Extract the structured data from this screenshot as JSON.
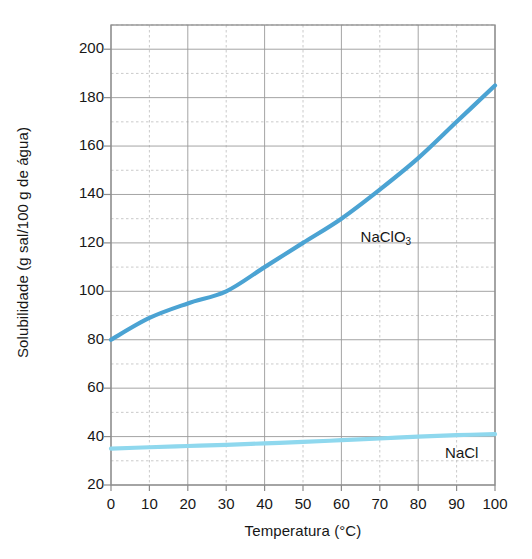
{
  "chart_data": {
    "type": "line",
    "title": "",
    "xlabel": "Temperatura (°C)",
    "ylabel": "Solubilidade (g sal/100 g de água)",
    "xlim": [
      0,
      100
    ],
    "ylim": [
      20,
      210
    ],
    "xticks": [
      0,
      10,
      20,
      30,
      40,
      50,
      60,
      70,
      80,
      90,
      100
    ],
    "xtick_labels": [
      "0",
      "10",
      "20",
      "30",
      "40",
      "50",
      "60",
      "70",
      "80",
      "90",
      "100"
    ],
    "yticks": [
      20,
      40,
      60,
      80,
      100,
      120,
      140,
      160,
      180,
      200
    ],
    "ytick_labels": [
      "20",
      "40",
      "60",
      "80",
      "100",
      "120",
      "140",
      "160",
      "180",
      "200"
    ],
    "grid": true,
    "grid_major_step_x": 20,
    "grid_major_step_y": 20,
    "grid_minor_step_x": 10,
    "grid_minor_step_y": 10,
    "legend": "inline-annotations",
    "x": [
      0,
      10,
      20,
      30,
      40,
      50,
      60,
      70,
      80,
      90,
      100
    ],
    "series": [
      {
        "name": "NaClO3",
        "label_html": "NaClO<sub>3</sub>",
        "color": "#4BA3D3",
        "values": [
          80,
          89,
          95,
          100,
          110,
          120,
          130,
          142,
          155,
          170,
          185
        ]
      },
      {
        "name": "NaCl",
        "label_html": "NaCl",
        "color": "#8FD8EE",
        "values": [
          35,
          35.6,
          36.1,
          36.6,
          37.2,
          37.8,
          38.5,
          39.2,
          40,
          40.6,
          41
        ]
      }
    ],
    "annotations": [
      {
        "text": "NaClO3",
        "x": 65,
        "y": 122
      },
      {
        "text": "NaCl",
        "x": 87,
        "y": 33
      }
    ],
    "colors": {
      "naclo3": "#4BA3D3",
      "nacl": "#8FD8EE",
      "grid_major": "#9a9a9a",
      "grid_minor": "#c4c4c4",
      "axis": "#8c8c8c",
      "text": "#171717",
      "background": "#ffffff"
    }
  }
}
